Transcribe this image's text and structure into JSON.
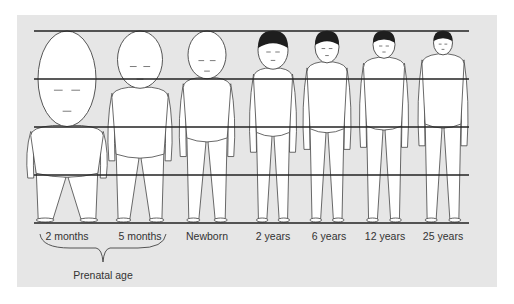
{
  "diagram": {
    "background_color": "#e6e6e6",
    "line_color": "#222222",
    "guide_lines_y": [
      31,
      79,
      127,
      175,
      223
    ],
    "figures": [
      {
        "label": "2 months",
        "cx": 67,
        "head_ratio": 0.5,
        "hair": false,
        "head_w": 58
      },
      {
        "label": "5 months",
        "cx": 140,
        "head_ratio": 0.3,
        "hair": false,
        "head_w": 45
      },
      {
        "label": "Newborn",
        "cx": 207,
        "head_ratio": 0.25,
        "hair": false,
        "head_w": 38
      },
      {
        "label": "2 years",
        "cx": 273,
        "head_ratio": 0.2,
        "hair": true,
        "head_w": 30
      },
      {
        "label": "6 years",
        "cx": 327,
        "head_ratio": 0.167,
        "hair": true,
        "head_w": 24
      },
      {
        "label": "12 years",
        "cx": 384,
        "head_ratio": 0.143,
        "hair": true,
        "head_w": 22
      },
      {
        "label": "25 years",
        "cx": 443,
        "head_ratio": 0.125,
        "hair": true,
        "head_w": 19
      }
    ],
    "group": {
      "label": "Prenatal age",
      "spans": [
        "2 months",
        "5 months"
      ]
    }
  }
}
